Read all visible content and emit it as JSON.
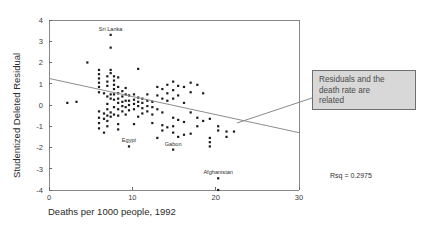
{
  "chart_data": {
    "type": "scatter",
    "title": "",
    "xlabel": "Deaths per 1000 people, 1992",
    "ylabel": "Studentized Deleted Residual",
    "xlim": [
      0,
      30
    ],
    "ylim": [
      -4,
      4
    ],
    "xticks": [
      0,
      10,
      20,
      30
    ],
    "yticks": [
      4,
      3,
      2,
      1,
      0,
      -1,
      -2,
      -3,
      -4
    ],
    "xtick_labels": [
      "0",
      "10",
      "20",
      "30"
    ],
    "ytick_labels": [
      "4",
      "3",
      "2",
      "1",
      "0",
      "-1",
      "-2",
      "-3",
      "-4"
    ],
    "grid": false,
    "legend": "none",
    "marker_color": "#1a1a1a",
    "regression_line": {
      "x": [
        0,
        30
      ],
      "y": [
        1.25,
        -1.3
      ],
      "color": "#8d8d8d"
    },
    "annotations": [
      {
        "text": "Rsq = 0.2975",
        "x_px": 330,
        "y_px": 178
      }
    ],
    "point_labels": [
      {
        "label": "Sri Lanka",
        "x": 7.4,
        "y": 3.3
      },
      {
        "label": "Egypt",
        "x": 9.6,
        "y": -1.95
      },
      {
        "label": "Gabon",
        "x": 14.9,
        "y": -2.1
      },
      {
        "label": "Afghanistan",
        "x": 20.3,
        "y": -3.45
      }
    ],
    "points": [
      [
        2.2,
        0.1
      ],
      [
        3.3,
        0.15
      ],
      [
        4.6,
        2.0
      ],
      [
        6.0,
        1.65
      ],
      [
        6.0,
        1.45
      ],
      [
        6.0,
        1.25
      ],
      [
        6.0,
        1.05
      ],
      [
        6.0,
        0.85
      ],
      [
        6.0,
        0.6
      ],
      [
        6.0,
        -0.3
      ],
      [
        6.0,
        -0.6
      ],
      [
        6.0,
        -0.85
      ],
      [
        6.0,
        -1.1
      ],
      [
        6.6,
        0.55
      ],
      [
        6.6,
        -0.4
      ],
      [
        6.6,
        -0.65
      ],
      [
        6.6,
        -1.3
      ],
      [
        7.0,
        1.35
      ],
      [
        7.0,
        1.1
      ],
      [
        7.0,
        0.9
      ],
      [
        7.0,
        0.4
      ],
      [
        7.0,
        0.05
      ],
      [
        7.0,
        -0.2
      ],
      [
        7.0,
        -0.5
      ],
      [
        7.0,
        -0.75
      ],
      [
        7.0,
        -1.0
      ],
      [
        7.4,
        3.3
      ],
      [
        7.4,
        2.7
      ],
      [
        7.4,
        1.65
      ],
      [
        7.4,
        1.5
      ],
      [
        7.4,
        0.5
      ],
      [
        7.4,
        0.3
      ],
      [
        7.4,
        -0.35
      ],
      [
        7.4,
        -0.55
      ],
      [
        7.8,
        1.35
      ],
      [
        7.8,
        1.15
      ],
      [
        7.8,
        0.95
      ],
      [
        7.8,
        0.75
      ],
      [
        7.8,
        0.5
      ],
      [
        7.8,
        0.25
      ],
      [
        7.8,
        -0.1
      ],
      [
        7.8,
        -0.45
      ],
      [
        8.3,
        1.3
      ],
      [
        8.3,
        0.85
      ],
      [
        8.3,
        0.55
      ],
      [
        8.3,
        0.3
      ],
      [
        8.3,
        0.1
      ],
      [
        8.3,
        -0.2
      ],
      [
        8.3,
        -0.5
      ],
      [
        8.3,
        -0.9
      ],
      [
        8.3,
        -1.15
      ],
      [
        8.8,
        0.65
      ],
      [
        8.8,
        0.4
      ],
      [
        8.8,
        0.15
      ],
      [
        8.8,
        -0.05
      ],
      [
        8.8,
        -0.3
      ],
      [
        9.2,
        0.8
      ],
      [
        9.2,
        0.5
      ],
      [
        9.2,
        0.2
      ],
      [
        9.2,
        -0.1
      ],
      [
        9.2,
        -0.45
      ],
      [
        9.6,
        0.45
      ],
      [
        9.6,
        0.2
      ],
      [
        9.6,
        0.0
      ],
      [
        9.6,
        -0.25
      ],
      [
        9.6,
        -1.95
      ],
      [
        10.2,
        0.5
      ],
      [
        10.2,
        0.25
      ],
      [
        10.2,
        0.05
      ],
      [
        10.2,
        -0.2
      ],
      [
        10.2,
        -0.9
      ],
      [
        10.7,
        1.7
      ],
      [
        10.7,
        0.35
      ],
      [
        10.7,
        0.15
      ],
      [
        10.7,
        -0.05
      ],
      [
        10.7,
        -0.55
      ],
      [
        11.2,
        0.3
      ],
      [
        11.2,
        0.1
      ],
      [
        11.2,
        -0.15
      ],
      [
        11.2,
        -0.4
      ],
      [
        11.8,
        0.5
      ],
      [
        11.8,
        0.2
      ],
      [
        11.8,
        -0.05
      ],
      [
        11.8,
        -0.3
      ],
      [
        12.4,
        0.15
      ],
      [
        12.4,
        -0.1
      ],
      [
        12.4,
        -0.45
      ],
      [
        12.4,
        -0.85
      ],
      [
        13.0,
        0.85
      ],
      [
        13.0,
        0.45
      ],
      [
        13.0,
        -0.2
      ],
      [
        13.0,
        -1.55
      ],
      [
        13.6,
        0.75
      ],
      [
        13.6,
        0.3
      ],
      [
        13.6,
        -0.35
      ],
      [
        13.6,
        -0.95
      ],
      [
        13.6,
        -1.2
      ],
      [
        14.2,
        0.95
      ],
      [
        14.2,
        0.55
      ],
      [
        14.2,
        0.2
      ],
      [
        14.2,
        -1.05
      ],
      [
        14.9,
        1.1
      ],
      [
        14.9,
        0.7
      ],
      [
        14.9,
        0.3
      ],
      [
        14.9,
        -0.6
      ],
      [
        14.9,
        -1.0
      ],
      [
        14.9,
        -1.3
      ],
      [
        14.9,
        -2.1
      ],
      [
        15.5,
        0.9
      ],
      [
        15.5,
        0.45
      ],
      [
        15.5,
        -0.7
      ],
      [
        15.5,
        -1.5
      ],
      [
        16.2,
        0.85
      ],
      [
        16.2,
        0.1
      ],
      [
        16.2,
        -0.8
      ],
      [
        16.2,
        -1.4
      ],
      [
        17.0,
        1.05
      ],
      [
        17.0,
        0.6
      ],
      [
        17.0,
        -0.35
      ],
      [
        17.0,
        -1.35
      ],
      [
        17.8,
        0.95
      ],
      [
        17.8,
        -0.6
      ],
      [
        17.8,
        -1.0
      ],
      [
        18.5,
        0.55
      ],
      [
        18.5,
        -0.75
      ],
      [
        19.3,
        -0.65
      ],
      [
        19.3,
        -1.55
      ],
      [
        19.3,
        -1.75
      ],
      [
        19.3,
        -1.95
      ],
      [
        20.3,
        -1.0
      ],
      [
        20.3,
        -1.2
      ],
      [
        20.3,
        -3.45
      ],
      [
        20.3,
        -4.0
      ],
      [
        21.3,
        -1.25
      ],
      [
        21.3,
        -1.5
      ],
      [
        22.2,
        -1.25
      ]
    ]
  },
  "callout": {
    "text": "Residuals and the\ndeath rate are\nrelated",
    "bg_color": "#d8d8d8",
    "border_color": "#6f6f6f"
  }
}
